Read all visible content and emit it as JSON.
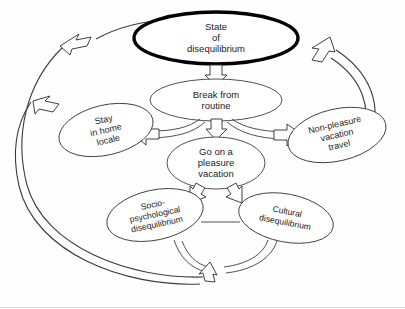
{
  "diagram": {
    "type": "flow-cycle",
    "background_color": "#fefefe",
    "line_color": "#3c3c3c",
    "emphasis_color": "#000000",
    "nodes": [
      {
        "id": "state-of-disequilibrium",
        "lines": [
          "State",
          "of",
          "disequilibrium"
        ],
        "emphasis": true,
        "rotation": 0,
        "cx": 216,
        "cy": 38,
        "rx": 82,
        "ry": 26,
        "font_size": 9.5,
        "line_height": 11
      },
      {
        "id": "break-from-routine",
        "lines": [
          "Break from",
          "routine"
        ],
        "emphasis": false,
        "rotation": 0,
        "cx": 216,
        "cy": 100,
        "rx": 66,
        "ry": 21,
        "font_size": 9.5,
        "line_height": 11
      },
      {
        "id": "go-on-a-pleasure-vacation",
        "lines": [
          "Go on a",
          "pleasure",
          "vacation"
        ],
        "emphasis": false,
        "rotation": 0,
        "cx": 216,
        "cy": 163,
        "rx": 49,
        "ry": 26,
        "font_size": 9.5,
        "line_height": 11
      },
      {
        "id": "stay-in-home-locale",
        "lines": [
          "Stay",
          "in home",
          "locale"
        ],
        "emphasis": false,
        "rotation": -13,
        "cx": 106,
        "cy": 130,
        "rx": 48,
        "ry": 25,
        "font_size": 9,
        "line_height": 10.5
      },
      {
        "id": "non-pleasure-vacation-travel",
        "lines": [
          "Non-pleasure",
          "vacation",
          "travel"
        ],
        "emphasis": false,
        "rotation": -13,
        "cx": 337,
        "cy": 135,
        "rx": 50,
        "ry": 26,
        "font_size": 9,
        "line_height": 10.5
      },
      {
        "id": "socio-psychological-disequilibrium",
        "lines": [
          "Socio-",
          "psychological",
          "disequilibrium"
        ],
        "emphasis": false,
        "rotation": -12,
        "cx": 155,
        "cy": 215,
        "rx": 49,
        "ry": 25,
        "font_size": 8.6,
        "line_height": 10
      },
      {
        "id": "cultural-disequilibrium",
        "lines": [
          "Cultural",
          "disequilibrium"
        ],
        "emphasis": false,
        "rotation": 11,
        "cx": 286,
        "cy": 218,
        "rx": 48,
        "ry": 24,
        "font_size": 8.6,
        "line_height": 10
      }
    ],
    "connections": [
      {
        "id": "state-to-break",
        "label": "State of disequilibrium leads to Break from routine",
        "kind": "block-arrow-down"
      },
      {
        "id": "break-to-vacation",
        "label": "Break from routine leads to Go on a pleasure vacation",
        "kind": "block-arrow-down"
      },
      {
        "id": "break-to-stay-home",
        "label": "Break from routine leads to Stay in home locale",
        "kind": "block-arrow-left"
      },
      {
        "id": "break-to-nonpleasure",
        "label": "Break from routine leads to Non-pleasure vacation travel",
        "kind": "block-arrow-right"
      },
      {
        "id": "vacation-to-socio",
        "label": "Go on a pleasure vacation leads to Socio-psychological disequilibrium",
        "kind": "block-arrow-diagonal-left"
      },
      {
        "id": "vacation-to-cultural",
        "label": "Go on a pleasure vacation leads to Cultural disequilibrium",
        "kind": "block-arrow-diagonal-right"
      },
      {
        "id": "bottom-converge",
        "label": "Socio-psychological and Cultural disequilibrium converge",
        "kind": "block-arrow-up"
      },
      {
        "id": "outer-loop-to-state",
        "label": "Feedback loop returning to State of disequilibrium",
        "kind": "curved-arrow"
      },
      {
        "id": "outer-loop-to-stay-home",
        "label": "Feedback loop returning to Stay in home locale",
        "kind": "curved-arrow"
      },
      {
        "id": "nonpleasure-to-state",
        "label": "Non-pleasure vacation travel returns to State of disequilibrium",
        "kind": "curved-arrow"
      }
    ]
  }
}
